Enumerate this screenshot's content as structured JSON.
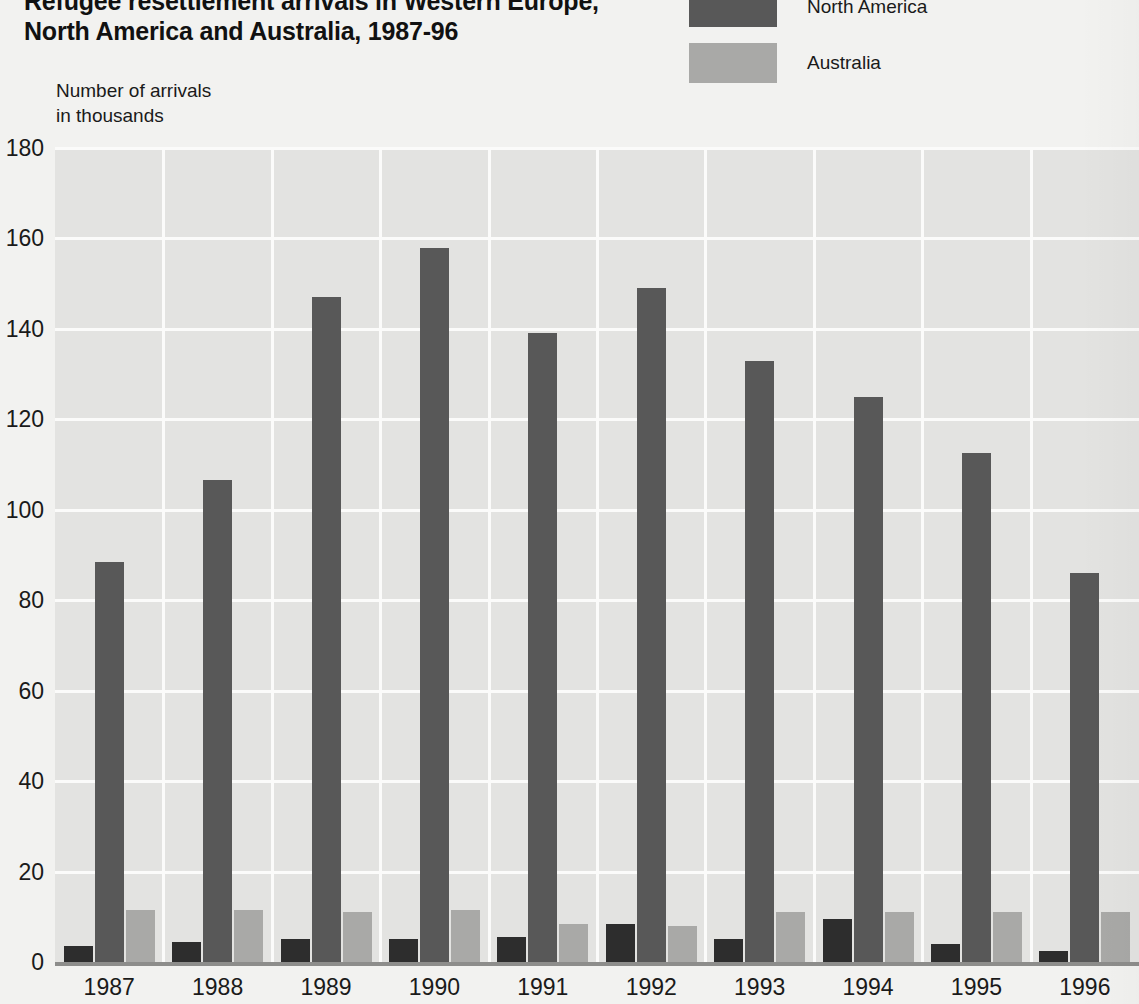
{
  "title": {
    "line1": "Refugee resettlement arrivals in Western Europe,",
    "line2": "North America and Australia, 1987-96"
  },
  "axis_caption": {
    "line1": "Number of arrivals",
    "line2": "in thousands"
  },
  "legend": {
    "items": [
      {
        "label": "North America",
        "color": "#585858"
      },
      {
        "label": "Australia",
        "color": "#a9a9a7"
      }
    ]
  },
  "colors": {
    "western_europe": "#2d2d2d",
    "north_america": "#585858",
    "australia": "#a9a9a7",
    "plot_background": "#e3e3e1",
    "page_background": "#f2f2f0",
    "gridline": "#fbfbfa",
    "baseline": "#8d8d8b"
  },
  "chart_data": {
    "type": "bar",
    "title": "Refugee resettlement arrivals in Western Europe, North America and Australia, 1987-96",
    "xlabel": "",
    "ylabel": "Number of arrivals in thousands",
    "ylim": [
      0,
      180
    ],
    "yticks": [
      0,
      20,
      40,
      60,
      80,
      100,
      120,
      140,
      160,
      180
    ],
    "grid": true,
    "legend_position": "top-right",
    "categories": [
      "1987",
      "1988",
      "1989",
      "1990",
      "1991",
      "1992",
      "1993",
      "1994",
      "1995",
      "1996"
    ],
    "series": [
      {
        "name": "Western Europe",
        "color": "#2d2d2d",
        "values": [
          3.5,
          4.5,
          5,
          5,
          5.5,
          8.5,
          5,
          9.5,
          4,
          2.5
        ]
      },
      {
        "name": "North America",
        "color": "#585858",
        "values": [
          88.5,
          106.5,
          147,
          158,
          139,
          149,
          133,
          125,
          112.5,
          86
        ]
      },
      {
        "name": "Australia",
        "color": "#a9a9a7",
        "values": [
          11.5,
          11.5,
          11,
          11.5,
          8.5,
          8,
          11,
          11,
          11,
          11
        ]
      }
    ]
  }
}
